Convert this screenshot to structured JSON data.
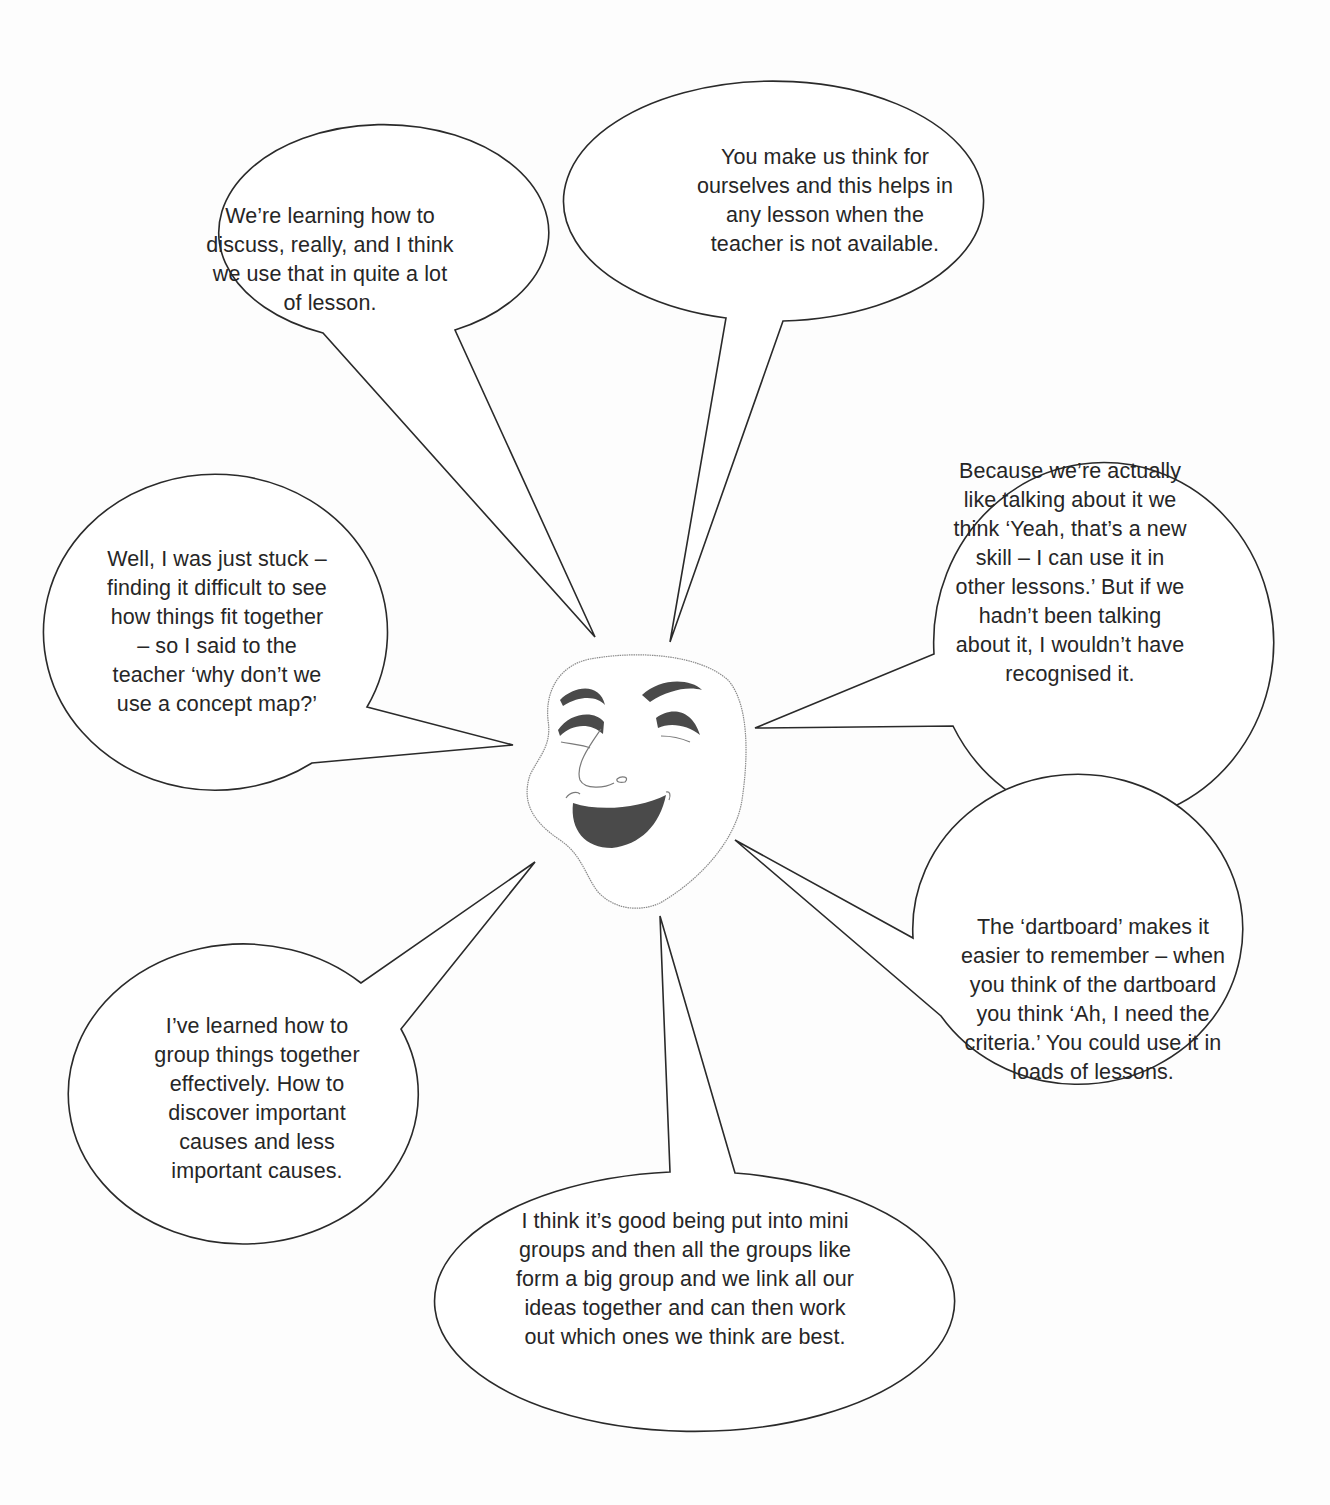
{
  "figure": {
    "type": "speech-bubble diagram",
    "center_icon": "smiling-comedy-mask-icon",
    "colors": {
      "background": "#fdfdfd",
      "bubble_fill": "#ffffff",
      "bubble_stroke": "#2a2a2a",
      "text": "#262626",
      "mask_features": "#4a4a4a"
    }
  },
  "bubbles": [
    {
      "id": "top-left",
      "lines": [
        "We’re learning how to",
        "discuss, really, and I think",
        "we use that in quite a lot",
        "of lesson."
      ]
    },
    {
      "id": "top-center",
      "lines": [
        "You make us think for",
        "ourselves and this helps in",
        "any lesson when the",
        "teacher is not available."
      ]
    },
    {
      "id": "right-upper",
      "lines": [
        "Because we’re actually",
        "like talking about it we",
        "think ‘Yeah, that’s a new",
        "skill – I can use it in",
        "other lessons.’ But if we",
        "hadn’t been talking",
        "about it, I wouldn’t have",
        "recognised it."
      ]
    },
    {
      "id": "left-upper",
      "lines": [
        "Well, I was just stuck –",
        "finding it difficult to see",
        "how things fit together",
        "– so I said to the",
        "teacher ‘why don’t we",
        "use a concept map?’"
      ]
    },
    {
      "id": "right-lower",
      "lines": [
        "The ‘dartboard’ makes it",
        "easier to remember – when",
        "you think of the dartboard",
        "you think ‘Ah, I need the",
        "criteria.’ You could use it in",
        "loads of lessons."
      ]
    },
    {
      "id": "left-lower",
      "lines": [
        "I’ve learned how to",
        "group things together",
        "effectively. How to",
        "discover important",
        "causes and less",
        "important causes."
      ]
    },
    {
      "id": "bottom",
      "lines": [
        "I think it’s good being put into mini",
        "groups and then all the groups like",
        "form a big group and we link all our",
        "ideas together and can then work",
        "out which ones we think are best."
      ]
    }
  ]
}
